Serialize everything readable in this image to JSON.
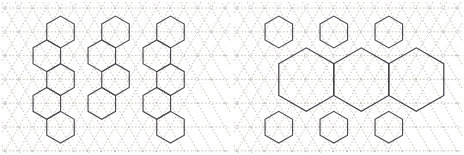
{
  "figure": {
    "panel_count": 2,
    "background_color": "#ffffff",
    "lattice_color": "#b9b2a8",
    "hexagon_color": "#4a4a52",
    "lattice_style": "dotted",
    "hexagon_style": "solid"
  },
  "chart_data": {
    "type": "diagram",
    "xlabel": "",
    "ylabel": "",
    "grid": true,
    "legend": "none",
    "panels": [
      {
        "name": "left-panel",
        "label": "",
        "description": "Uniform small hexagons in staggered rows over dotted triangular lattice",
        "lattice": {
          "type": "triangular",
          "cell_width": 27.5,
          "row_height": 23.8,
          "origin_x": 5,
          "origin_y": 8,
          "columns": 9,
          "rows": 7,
          "color": "#b9b2a8",
          "dash": "1.6 1.9"
        },
        "hexagons": [
          {
            "cx": 60.5,
            "cy": 32.0,
            "r": 27.5,
            "size": "small"
          },
          {
            "cx": 115.5,
            "cy": 32.0,
            "r": 27.5,
            "size": "small"
          },
          {
            "cx": 170.5,
            "cy": 32.0,
            "r": 27.5,
            "size": "small"
          },
          {
            "cx": 46.8,
            "cy": 55.8,
            "r": 27.5,
            "size": "small"
          },
          {
            "cx": 101.8,
            "cy": 55.8,
            "r": 27.5,
            "size": "small"
          },
          {
            "cx": 156.8,
            "cy": 55.8,
            "r": 27.5,
            "size": "small"
          },
          {
            "cx": 60.5,
            "cy": 79.6,
            "r": 27.5,
            "size": "small"
          },
          {
            "cx": 115.5,
            "cy": 79.6,
            "r": 27.5,
            "size": "small"
          },
          {
            "cx": 170.5,
            "cy": 79.6,
            "r": 27.5,
            "size": "small"
          },
          {
            "cx": 46.8,
            "cy": 103.4,
            "r": 27.5,
            "size": "small"
          },
          {
            "cx": 101.8,
            "cy": 103.4,
            "r": 27.5,
            "size": "small"
          },
          {
            "cx": 156.8,
            "cy": 103.4,
            "r": 27.5,
            "size": "small"
          },
          {
            "cx": 60.5,
            "cy": 127.2,
            "r": 27.5,
            "size": "small"
          },
          {
            "cx": 170.5,
            "cy": 127.2,
            "r": 27.5,
            "size": "small"
          }
        ],
        "hexagon_count": 14,
        "hexagon_sizes": [
          "small"
        ]
      },
      {
        "name": "right-panel",
        "label": "",
        "description": "Mixed small and large hexagons over dotted triangular lattice",
        "lattice": {
          "type": "triangular",
          "cell_width": 27.5,
          "row_height": 23.8,
          "origin_x": 5,
          "origin_y": 8,
          "columns": 9,
          "rows": 7,
          "color": "#b9b2a8",
          "dash": "1.6 1.9"
        },
        "hexagons": [
          {
            "cx": 46.8,
            "cy": 32.0,
            "r": 27.5,
            "size": "small"
          },
          {
            "cx": 101.8,
            "cy": 32.0,
            "r": 27.5,
            "size": "small"
          },
          {
            "cx": 156.8,
            "cy": 32.0,
            "r": 27.5,
            "size": "small"
          },
          {
            "cx": 74.3,
            "cy": 79.6,
            "r": 55.0,
            "size": "large"
          },
          {
            "cx": 129.3,
            "cy": 79.6,
            "r": 55.0,
            "size": "large"
          },
          {
            "cx": 184.3,
            "cy": 79.6,
            "r": 55.0,
            "size": "large"
          },
          {
            "cx": 46.8,
            "cy": 127.2,
            "r": 27.5,
            "size": "small"
          },
          {
            "cx": 101.8,
            "cy": 127.2,
            "r": 27.5,
            "size": "small"
          },
          {
            "cx": 156.8,
            "cy": 127.2,
            "r": 27.5,
            "size": "small"
          }
        ],
        "hexagon_count": 9,
        "hexagon_sizes": [
          "small",
          "large"
        ]
      }
    ]
  }
}
